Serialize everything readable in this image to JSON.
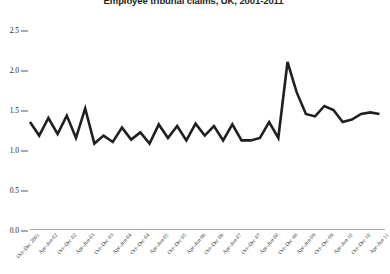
{
  "chart_data": {
    "type": "line",
    "title": "Employee tribunal claims, UK, 2001-2011",
    "xlabel": "",
    "ylabel": "",
    "ylim": [
      0.0,
      2.5
    ],
    "ytick_labels": [
      "0.0",
      "0.5",
      "1.0",
      "1.5",
      "2.0",
      "2.5"
    ],
    "ytick_values": [
      0.0,
      0.5,
      1.0,
      1.5,
      2.0,
      2.5
    ],
    "grid": false,
    "legend": "none",
    "line_color": "#231f20",
    "axis_color": "#a7a9ac",
    "categories": [
      "Oct–Dec 2001",
      "Jan–Mar 02",
      "Apr–Jun 02",
      "Jul–Sep 02",
      "Oct–Dec 02",
      "Jan–Mar 03",
      "Apr–Jun 03",
      "Jul–Sep 03",
      "Oct–Dec 03",
      "Jan–Mar 04",
      "Apr–Jun 04",
      "Jul–Sep 04",
      "Oct–Dec 04",
      "Jan–Mar 05",
      "Apr–Jun 05",
      "Jul–Sep 05",
      "Oct–Dec 05",
      "Jan–Mar 06",
      "Apr–Jun 06",
      "Jul–Sep 06",
      "Oct–Dec 06",
      "Jan–Mar 07",
      "Apr–Jun 07",
      "Jul–Sep 07",
      "Oct–Dec 07",
      "Jan–Mar 08",
      "Apr–Jun 08",
      "Jul–Sep 08",
      "Oct–Dec 08",
      "Jan–Mar 09",
      "Apr–Jun 09",
      "Jul–Sep 09",
      "Oct–Dec 09",
      "Jan–Mar 10",
      "Apr–Jun 10",
      "Jul–Sep 10",
      "Oct–Dec 10",
      "Jan–Mar 11",
      "Apr–Jun 11"
    ],
    "visible_tick_labels": [
      {
        "index": 0,
        "label": "Oct–Dec 2001"
      },
      {
        "index": 2,
        "label": "Apr–Jun 02"
      },
      {
        "index": 4,
        "label": "Oct–Dec 02"
      },
      {
        "index": 6,
        "label": "Apr–Jun 03"
      },
      {
        "index": 8,
        "label": "Oct–Dec 03"
      },
      {
        "index": 10,
        "label": "Apr–Jun 04"
      },
      {
        "index": 12,
        "label": "Oct–Dec 04"
      },
      {
        "index": 14,
        "label": "Apr–Jun 05"
      },
      {
        "index": 16,
        "label": "Oct–Dec 05"
      },
      {
        "index": 18,
        "label": "Apr–Jun 06"
      },
      {
        "index": 20,
        "label": "Oct–Dec 06"
      },
      {
        "index": 22,
        "label": "Apr–Jun 07"
      },
      {
        "index": 24,
        "label": "Oct–Dec 07"
      },
      {
        "index": 26,
        "label": "Apr–Jun 08"
      },
      {
        "index": 28,
        "label": "Oct–Dec 08"
      },
      {
        "index": 30,
        "label": "Apr–Jun 09"
      },
      {
        "index": 32,
        "label": "Oct–Dec 09"
      },
      {
        "index": 34,
        "label": "Apr–Jun 10"
      },
      {
        "index": 36,
        "label": "Oct–Dec 10"
      },
      {
        "index": 38,
        "label": "Apr–Jun 11"
      }
    ],
    "values": [
      1.35,
      1.18,
      1.4,
      1.2,
      1.43,
      1.15,
      1.52,
      1.08,
      1.18,
      1.1,
      1.28,
      1.13,
      1.22,
      1.08,
      1.32,
      1.15,
      1.3,
      1.12,
      1.33,
      1.18,
      1.3,
      1.12,
      1.32,
      1.12,
      1.12,
      1.15,
      1.35,
      1.15,
      2.1,
      1.72,
      1.45,
      1.42,
      1.55,
      1.5,
      1.35,
      1.38,
      1.45,
      1.47,
      1.45
    ]
  }
}
